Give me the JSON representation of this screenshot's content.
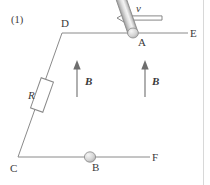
{
  "figure": {
    "number_label": "(1)",
    "type": "physics-diagram"
  },
  "colors": {
    "wire": "#8a8a8a",
    "label": "#3a3a3a",
    "arrow": "#6e6e6e",
    "rod_light": "#f2f2f2",
    "rod_mid": "#d2d2d2",
    "rod_dark": "#9e9e9e",
    "background": "#ffffff",
    "page_edge": "#d8d8d8"
  },
  "labels": {
    "point_a": "A",
    "point_b": "B",
    "point_c": "C",
    "point_d": "D",
    "point_e": "E",
    "point_f": "F",
    "resistor": "R",
    "velocity": "v",
    "field_left": "B",
    "field_right": "B"
  },
  "geometry": {
    "rail_top": {
      "x1": 62,
      "y1": 33,
      "x2": 188,
      "y2": 33
    },
    "rail_bottom": {
      "x1": 18,
      "y1": 157,
      "x2": 150,
      "y2": 157
    },
    "connector_dc": {
      "x1": 62,
      "y1": 33,
      "x2": 18,
      "y2": 157
    },
    "rod": {
      "ax": 133,
      "ay": 33,
      "bx": 90,
      "by": 157,
      "radius": 5
    },
    "resistor": {
      "cx": 42,
      "cy": 95,
      "width": 13,
      "height": 32,
      "angle": 20
    },
    "velocity_arrow": {
      "x_tail": 162,
      "x_head": 117,
      "y": 18
    },
    "field_arrow_left": {
      "x": 77,
      "y_tail": 97,
      "y_head": 63
    },
    "field_arrow_right": {
      "x": 145,
      "y_tail": 97,
      "y_head": 63
    }
  }
}
